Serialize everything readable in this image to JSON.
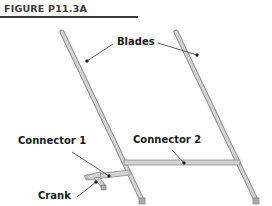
{
  "figure": {
    "title": "FIGURE P11.3A"
  },
  "labels": {
    "blades": "Blades",
    "connector1": "Connector 1",
    "connector2": "Connector 2",
    "crank": "Crank"
  },
  "colors": {
    "bar_fill": "#c8c8c8",
    "bar_stroke": "#8a8a8a",
    "leader": "#333333",
    "title": "#3a3a3a"
  }
}
